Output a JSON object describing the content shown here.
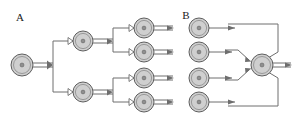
{
  "figure": {
    "background_color": "#ffffff",
    "width": 299,
    "height": 123,
    "node_fill_color": "#cfcfcf",
    "node_stroke_color": "#5e5e5e",
    "node_core_color": "#8f8f8f",
    "edge_color": "#6e6e6e",
    "label_color": "#1a1a1a"
  },
  "panels": [
    {
      "id": "panel-a",
      "label": "A",
      "label_x": 20,
      "label_y": 21,
      "description": "Branching fan-out tree: one root node splits into two intermediate nodes, each of which splits into two leaf nodes with outgoing arrows.",
      "nodes": [
        {
          "id": "a-root",
          "role": "root",
          "cx": 22,
          "cy": 65,
          "r": 11
        },
        {
          "id": "a-mid-1",
          "role": "intermediate",
          "cx": 83,
          "cy": 41,
          "r": 10
        },
        {
          "id": "a-mid-2",
          "role": "intermediate",
          "cx": 83,
          "cy": 92,
          "r": 10
        },
        {
          "id": "a-leaf-1",
          "role": "leaf",
          "cx": 144,
          "cy": 28,
          "r": 10
        },
        {
          "id": "a-leaf-2",
          "role": "leaf",
          "cx": 144,
          "cy": 52,
          "r": 10
        },
        {
          "id": "a-leaf-3",
          "role": "leaf",
          "cx": 144,
          "cy": 78,
          "r": 10
        },
        {
          "id": "a-leaf-4",
          "role": "leaf",
          "cx": 144,
          "cy": 102,
          "r": 10
        }
      ],
      "edges": [
        {
          "id": "a-e-root-split",
          "from": "a-root",
          "to": "split-bus"
        },
        {
          "id": "a-e-split-mid-1",
          "from": "split-bus",
          "to": "a-mid-1"
        },
        {
          "id": "a-e-split-mid-2",
          "from": "split-bus",
          "to": "a-mid-2"
        },
        {
          "id": "a-e-mid1-leaf-1",
          "from": "a-mid-1",
          "to": "a-leaf-1"
        },
        {
          "id": "a-e-mid1-leaf-2",
          "from": "a-mid-1",
          "to": "a-leaf-2"
        },
        {
          "id": "a-e-mid2-leaf-3",
          "from": "a-mid-2",
          "to": "a-leaf-3"
        },
        {
          "id": "a-e-mid2-leaf-4",
          "from": "a-mid-2",
          "to": "a-leaf-4"
        },
        {
          "id": "a-out-1",
          "from": "a-leaf-1",
          "to": "output"
        },
        {
          "id": "a-out-2",
          "from": "a-leaf-2",
          "to": "output"
        },
        {
          "id": "a-out-3",
          "from": "a-leaf-3",
          "to": "output"
        },
        {
          "id": "a-out-4",
          "from": "a-leaf-4",
          "to": "output"
        }
      ]
    },
    {
      "id": "panel-b",
      "label": "B",
      "label_x": 186,
      "label_y": 19,
      "description": "Converging fan-in: four source nodes all feed into a single merge node, which emits one outgoing arrow.",
      "nodes": [
        {
          "id": "b-src-1",
          "role": "source",
          "cx": 199,
          "cy": 28,
          "r": 10
        },
        {
          "id": "b-src-2",
          "role": "source",
          "cx": 199,
          "cy": 52,
          "r": 10
        },
        {
          "id": "b-src-3",
          "role": "source",
          "cx": 199,
          "cy": 78,
          "r": 10
        },
        {
          "id": "b-src-4",
          "role": "source",
          "cx": 199,
          "cy": 102,
          "r": 10
        },
        {
          "id": "b-merge",
          "role": "merge",
          "cx": 262,
          "cy": 65,
          "r": 11
        }
      ],
      "edges": [
        {
          "id": "b-e-1",
          "from": "b-src-1",
          "to": "b-merge"
        },
        {
          "id": "b-e-2",
          "from": "b-src-2",
          "to": "b-merge"
        },
        {
          "id": "b-e-3",
          "from": "b-src-3",
          "to": "b-merge"
        },
        {
          "id": "b-e-4",
          "from": "b-src-4",
          "to": "b-merge"
        },
        {
          "id": "b-out",
          "from": "b-merge",
          "to": "output"
        }
      ]
    }
  ]
}
